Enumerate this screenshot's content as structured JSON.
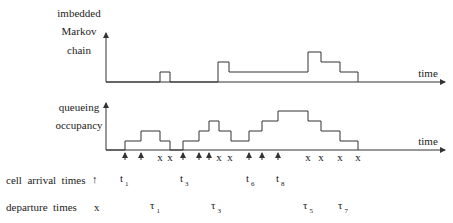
{
  "top_panel": {
    "label_lines": [
      "imbedded",
      "Markov",
      "chain"
    ],
    "x_axis_label": "time",
    "steps": [
      [
        106,
        82
      ],
      [
        160,
        82
      ],
      [
        160,
        72
      ],
      [
        170,
        72
      ],
      [
        170,
        82
      ],
      [
        218,
        82
      ],
      [
        218,
        62
      ],
      [
        229,
        62
      ],
      [
        229,
        72
      ],
      [
        308,
        72
      ],
      [
        308,
        52
      ],
      [
        321,
        52
      ],
      [
        321,
        62
      ],
      [
        340,
        62
      ],
      [
        340,
        72
      ],
      [
        358,
        72
      ],
      [
        358,
        82
      ]
    ]
  },
  "bottom_panel": {
    "label_lines": [
      "queueing",
      "occupancy"
    ],
    "x_axis_label": "time",
    "steps": [
      [
        106,
        150
      ],
      [
        125,
        150
      ],
      [
        125,
        141
      ],
      [
        141,
        141
      ],
      [
        141,
        131
      ],
      [
        160,
        131
      ],
      [
        160,
        141
      ],
      [
        170,
        141
      ],
      [
        170,
        150
      ],
      [
        183,
        150
      ],
      [
        183,
        141
      ],
      [
        199,
        141
      ],
      [
        199,
        131
      ],
      [
        209,
        131
      ],
      [
        209,
        121
      ],
      [
        219,
        121
      ],
      [
        219,
        131
      ],
      [
        231,
        131
      ],
      [
        231,
        141
      ],
      [
        249,
        141
      ],
      [
        249,
        131
      ],
      [
        262,
        131
      ],
      [
        262,
        121
      ],
      [
        278,
        121
      ],
      [
        278,
        111
      ],
      [
        308,
        111
      ],
      [
        308,
        121
      ],
      [
        321,
        121
      ],
      [
        321,
        131
      ],
      [
        340,
        131
      ],
      [
        340,
        141
      ],
      [
        358,
        141
      ],
      [
        358,
        150
      ]
    ],
    "arrival_x": [
      125,
      141,
      183,
      199,
      209,
      249,
      262,
      278
    ],
    "departure_x": [
      160,
      170,
      219,
      230,
      308,
      321,
      340,
      358
    ]
  },
  "legend": {
    "arrival_label": "cell  arrival  times",
    "arrival_symbol": "↑",
    "departure_label": "departure  times",
    "departure_symbol": "x"
  },
  "arrival_annotations": [
    {
      "base": "t",
      "sub": "1",
      "x": 120
    },
    {
      "base": "t",
      "sub": "3",
      "x": 180
    },
    {
      "base": "t",
      "sub": "6",
      "x": 246
    },
    {
      "base": "t",
      "sub": "8",
      "x": 276
    }
  ],
  "departure_annotations": [
    {
      "base": "τ",
      "sub": "1",
      "x": 150
    },
    {
      "base": "τ",
      "sub": "3",
      "x": 211
    },
    {
      "base": "τ",
      "sub": "5",
      "x": 303
    },
    {
      "base": "τ",
      "sub": "7",
      "x": 338
    }
  ]
}
